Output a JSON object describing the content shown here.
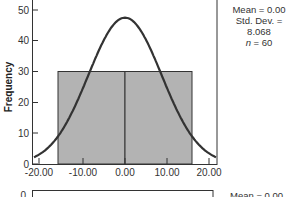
{
  "chart_data": [
    {
      "type": "bar",
      "subtype": "histogram_with_normal_curve",
      "title": "",
      "xlabel": "",
      "ylabel": "Frequency",
      "xlim": [
        -20,
        20
      ],
      "ylim": [
        0,
        50
      ],
      "x_ticks": [
        "-20.00",
        "-10.00",
        "0.00",
        "10.00",
        "20.00"
      ],
      "y_ticks": [
        "0",
        "10",
        "20",
        "30",
        "40",
        "50"
      ],
      "bins": [
        {
          "from": -15,
          "to": 0,
          "count": 30
        },
        {
          "from": 0,
          "to": 15,
          "count": 30
        }
      ],
      "normal_curve": {
        "mean": 0.0,
        "std_dev": 8.068,
        "peak": 47.5
      },
      "annotations": {
        "mean": "Mean = 0.00",
        "std_dev": "Std. Dev. = 8.068",
        "n_label": "n",
        "n_value": "= 60"
      },
      "grid": false,
      "legend": "none"
    }
  ],
  "partial_chart_below": {
    "y_tick_visible": "0",
    "annotation_fragment": "Mean = 0.00"
  }
}
